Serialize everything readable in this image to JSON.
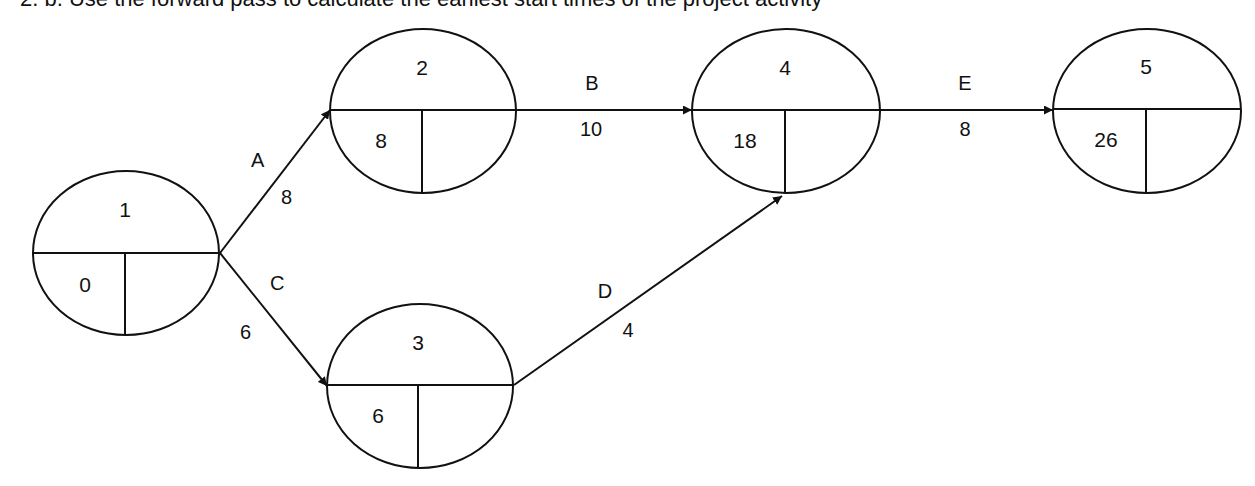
{
  "heading": {
    "text": "2. b. Use the forward pass to calculate the earliest start times of the project activity",
    "note": "top line clipped by image edge"
  },
  "diagram": {
    "type": "activity-on-arrow network (forward pass)",
    "nodes": [
      {
        "id": "1",
        "label": "1",
        "earliest": "0",
        "latest": ""
      },
      {
        "id": "2",
        "label": "2",
        "earliest": "8",
        "latest": ""
      },
      {
        "id": "3",
        "label": "3",
        "earliest": "6",
        "latest": ""
      },
      {
        "id": "4",
        "label": "4",
        "earliest": "18",
        "latest": ""
      },
      {
        "id": "5",
        "label": "5",
        "earliest": "26",
        "latest": ""
      }
    ],
    "edges": [
      {
        "activity": "A",
        "duration": "8",
        "from": "1",
        "to": "2"
      },
      {
        "activity": "C",
        "duration": "6",
        "from": "1",
        "to": "3"
      },
      {
        "activity": "B",
        "duration": "10",
        "from": "2",
        "to": "4"
      },
      {
        "activity": "D",
        "duration": "4",
        "from": "3",
        "to": "4"
      },
      {
        "activity": "E",
        "duration": "8",
        "from": "4",
        "to": "5"
      }
    ]
  }
}
